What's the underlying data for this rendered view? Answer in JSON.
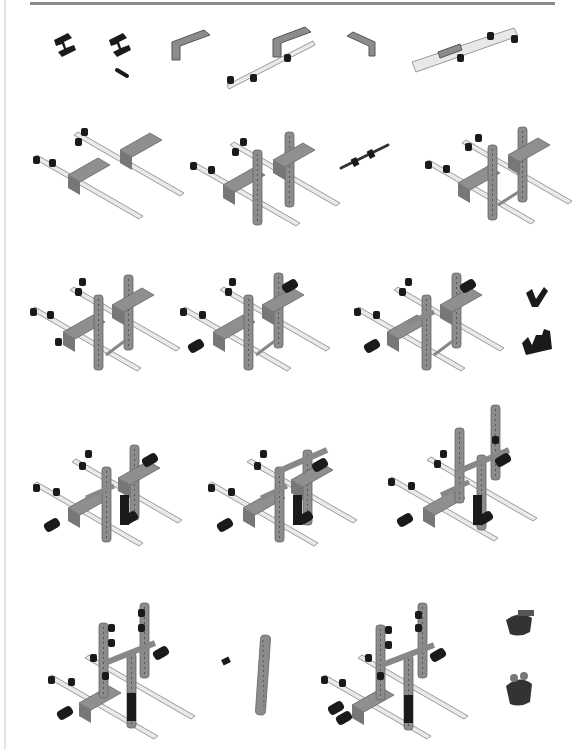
{
  "page": {
    "type": "assembly-instructions",
    "colors": {
      "beam_gray": "#8c8c8c",
      "beam_light": "#e6e6e6",
      "pin_black": "#1a1a1a",
      "rule": "#8a8a8a"
    }
  },
  "rows": [
    {
      "row": 1,
      "items": [
        {
          "id": "r1a",
          "label": "cross-block part"
        },
        {
          "id": "r1b",
          "label": "cross-block with axle part"
        },
        {
          "id": "r1c",
          "label": "L-beam part"
        },
        {
          "id": "r1d",
          "label": "L-beam and long beam sub-assembly"
        },
        {
          "id": "r1e",
          "label": "L-beam part"
        },
        {
          "id": "r1f",
          "label": "long beam sub-assembly"
        }
      ]
    },
    {
      "row": 2,
      "items": [
        {
          "id": "r2a",
          "label": "two long beams with L-beams"
        },
        {
          "id": "r2b",
          "label": "frame with two vertical beams"
        },
        {
          "id": "r2c",
          "label": "axle with bushings"
        },
        {
          "id": "r2d",
          "label": "frame with connecting axle"
        }
      ]
    },
    {
      "row": 3,
      "items": [
        {
          "id": "r3a",
          "label": "frame step"
        },
        {
          "id": "r3b",
          "label": "frame with pins added"
        },
        {
          "id": "r3c",
          "label": "frame with cross axle"
        },
        {
          "id": "r3d",
          "label": "angle connector parts"
        }
      ]
    },
    {
      "row": 4,
      "items": [
        {
          "id": "r4a",
          "label": "frame with black connectors"
        },
        {
          "id": "r4b",
          "label": "frame with upper axle"
        },
        {
          "id": "r4c",
          "label": "frame with tall vertical beam"
        }
      ]
    },
    {
      "row": 5,
      "items": [
        {
          "id": "r5a",
          "label": "frame with pins on vertical beams"
        },
        {
          "id": "r5b",
          "label": "vertical beam and pin parts"
        },
        {
          "id": "r5c",
          "label": "completed frame assembly"
        },
        {
          "id": "r5d",
          "label": "gear hub parts"
        }
      ]
    }
  ]
}
